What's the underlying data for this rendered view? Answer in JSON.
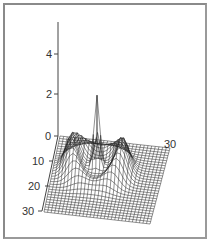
{
  "chart_data": {
    "type": "surface3d",
    "title": "",
    "z_axis": {
      "ticks": [
        0,
        2,
        4
      ],
      "range": [
        0,
        5.3
      ]
    },
    "x_axis": {
      "ticks": [
        0,
        10,
        20,
        30
      ],
      "range": [
        0,
        30
      ]
    },
    "y_axis": {
      "ticks": [
        0,
        30
      ],
      "range": [
        0,
        30
      ]
    },
    "grid": true,
    "peaks": [
      {
        "name": "left-peak",
        "height": 1.7
      },
      {
        "name": "center-spike",
        "height": 3.5
      },
      {
        "name": "right-peak",
        "height": 1.6
      }
    ],
    "colors": {
      "mesh": "#222222",
      "frame": "#8a8a8a",
      "axis": "#444444"
    }
  },
  "labels": {
    "z4": "4",
    "z2": "2",
    "z0": "0",
    "x0": "0",
    "x10": "10",
    "x20": "20",
    "x30": "30",
    "y30": "30"
  }
}
